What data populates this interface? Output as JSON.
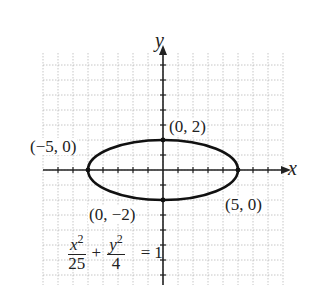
{
  "chart_data": {
    "type": "line",
    "title": "",
    "equation": {
      "x_term": "x",
      "x_denominator": "25",
      "plus": "+",
      "y_term": "y",
      "y_denominator": "4",
      "exponent": "2",
      "equals": "=",
      "rhs": "1"
    },
    "xlabel": "x",
    "ylabel": "y",
    "xlim": [
      -8,
      8
    ],
    "ylim": [
      -7.5,
      7.5
    ],
    "grid": true,
    "series": [
      {
        "name": "ellipse",
        "a": 5,
        "b": 2,
        "center": [
          0,
          0
        ]
      }
    ],
    "annotations": [
      {
        "text": "(0, 2)",
        "point": [
          0,
          2
        ]
      },
      {
        "text": "(−5, 0)",
        "point": [
          -5,
          0
        ]
      },
      {
        "text": "(5, 0)",
        "point": [
          5,
          0
        ]
      },
      {
        "text": "(0, −2)",
        "point": [
          0,
          -2
        ]
      }
    ]
  },
  "layout": {
    "origin_px": [
      163,
      170
    ],
    "unit_px": 15,
    "grid_left": 43,
    "grid_right": 283,
    "grid_top": 53,
    "grid_bottom": 285
  },
  "colors": {
    "curve": "#111111",
    "axis": "#222222",
    "grid": "#b8b8b8"
  }
}
